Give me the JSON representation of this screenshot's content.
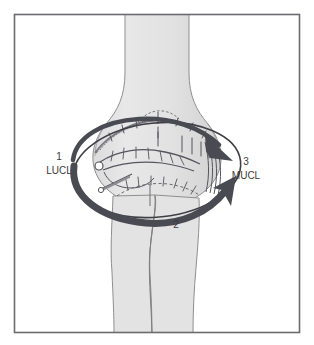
{
  "figure": {
    "view": "anterior elbow",
    "background_color": "#ffffff",
    "frame_color": "#6b6b70",
    "bone_fill": "#e4e4e4",
    "bone_outline": "#8c8c8c",
    "arrow_color": "#4a4a52",
    "ink_color": "#55555c",
    "label_color": "#3a3a3a"
  },
  "labels": {
    "left": {
      "number": "1",
      "name": "LUCL",
      "meaning": "lateral ulnar collateral ligament"
    },
    "bottom": {
      "number": "2",
      "name": ""
    },
    "right": {
      "number": "3",
      "name": "MUCL",
      "meaning": "medial ulnar collateral ligament"
    }
  },
  "annotations": {
    "arrow_upper": "curved arrow sweeping from lateral to medial, arrowhead down-right",
    "arrow_lower": "curved arrow sweeping from lateral inferior to medial, arrowhead up-right",
    "ring": "thin elliptical ring encircling the joint",
    "capsule": "stippled capsule band across superior joint line"
  }
}
